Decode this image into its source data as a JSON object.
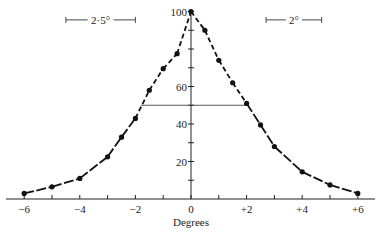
{
  "chart_data": {
    "type": "line",
    "title": "",
    "xlabel": "Degrees",
    "ylabel": "",
    "xlim": [
      -6.5,
      6.5
    ],
    "ylim": [
      0,
      100
    ],
    "x_ticks": [
      -6,
      -5,
      -4,
      -3,
      -2,
      -1,
      0,
      1,
      2,
      3,
      4,
      5,
      6
    ],
    "x_tick_labels": [
      {
        "x": -6,
        "label": "−6"
      },
      {
        "x": -4,
        "label": "−4"
      },
      {
        "x": -2,
        "label": "−2"
      },
      {
        "x": 0,
        "label": "0"
      },
      {
        "x": 2,
        "label": "+2"
      },
      {
        "x": 4,
        "label": "+4"
      },
      {
        "x": 6,
        "label": "+6"
      }
    ],
    "y_ticks": [
      10,
      20,
      30,
      40,
      50,
      60,
      70,
      80,
      90,
      100
    ],
    "y_tick_labels": [
      {
        "y": 20,
        "label": "20"
      },
      {
        "y": 40,
        "label": "40"
      },
      {
        "y": 60,
        "label": "60"
      },
      {
        "y": 100,
        "label": "100"
      }
    ],
    "series": [
      {
        "name": "response",
        "x": [
          -6,
          -5,
          -4,
          -3,
          -2.5,
          -2,
          -1.5,
          -1,
          -0.5,
          0,
          0.5,
          1,
          1.5,
          2,
          2.5,
          3,
          4,
          5,
          6
        ],
        "y": [
          3,
          6.5,
          11,
          22.5,
          33,
          43,
          58,
          69.5,
          77.5,
          100,
          90,
          74,
          62,
          51,
          39.5,
          28,
          14.5,
          7.5,
          3
        ]
      }
    ],
    "dashed_range": [
      -2,
      2
    ],
    "annotations": [
      {
        "type": "half-max-line",
        "y": 50,
        "x_from": -1.8,
        "x_to": 2.0
      },
      {
        "type": "scale-bar",
        "label": "2·5°",
        "x_from": -4.5,
        "x_to": -2.0,
        "y": 95
      },
      {
        "type": "scale-bar",
        "label": "2°",
        "x_from": 2.7,
        "x_to": 4.7,
        "y": 95
      }
    ],
    "grid": false,
    "legend": null
  }
}
